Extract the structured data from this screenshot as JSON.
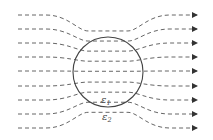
{
  "diagram": {
    "title": "",
    "sphere": {
      "cx": 108,
      "cy": 72,
      "r": 35
    },
    "labels": {
      "inside": {
        "base": "ε",
        "sub": "1"
      },
      "outside": {
        "base": "ε",
        "sub": "2"
      }
    },
    "field_lines": {
      "count": 9,
      "x_start": 18,
      "x_end": 197,
      "y": [
        15,
        29,
        43,
        57,
        71,
        86,
        100,
        114,
        128
      ],
      "direction": "left-to-right"
    },
    "colors": {
      "line": "#555555",
      "sphere": "#444444",
      "background": "#ffffff"
    }
  }
}
